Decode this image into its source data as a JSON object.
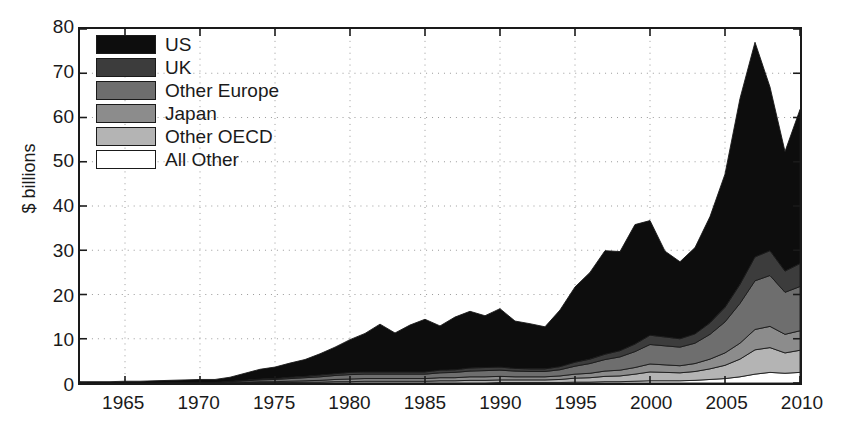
{
  "chart_data": {
    "type": "area",
    "stacked": true,
    "title": "",
    "subtitle": "",
    "xlabel": "",
    "ylabel": "$ billions",
    "xlim": [
      1962,
      2010
    ],
    "ylim": [
      0,
      80
    ],
    "yticks": [
      0,
      10,
      20,
      30,
      40,
      50,
      60,
      70,
      80
    ],
    "xticks": [
      1965,
      1970,
      1975,
      1980,
      1985,
      1990,
      1995,
      2000,
      2005,
      2010
    ],
    "grid": "dotted-both",
    "legend_position": "upper-left-inside",
    "x": [
      1962,
      1963,
      1964,
      1965,
      1966,
      1967,
      1968,
      1969,
      1970,
      1971,
      1972,
      1973,
      1974,
      1975,
      1976,
      1977,
      1978,
      1979,
      1980,
      1981,
      1982,
      1983,
      1984,
      1985,
      1986,
      1987,
      1988,
      1989,
      1990,
      1991,
      1992,
      1993,
      1994,
      1995,
      1996,
      1997,
      1998,
      1999,
      2000,
      2001,
      2002,
      2003,
      2004,
      2005,
      2006,
      2007,
      2008,
      2009,
      2010
    ],
    "series": [
      {
        "name": "All Other",
        "color": "#ffffff",
        "values": [
          0.0,
          0.0,
          0.0,
          0.0,
          0.0,
          0.0,
          0.0,
          0.0,
          0.0,
          0.0,
          0.0,
          0.0,
          0.0,
          0.0,
          0.0,
          0.0,
          0.0,
          0.0,
          0.0,
          0.0,
          0.0,
          0.0,
          0.0,
          0.0,
          0.0,
          0.0,
          0.0,
          0.0,
          0.1,
          0.1,
          0.1,
          0.1,
          0.1,
          0.2,
          0.2,
          0.3,
          0.3,
          0.4,
          0.5,
          0.5,
          0.5,
          0.6,
          0.8,
          1.0,
          1.4,
          2.0,
          2.4,
          2.2,
          2.4
        ]
      },
      {
        "name": "Other OECD",
        "color": "#b4b4b4",
        "values": [
          0.0,
          0.0,
          0.0,
          0.0,
          0.0,
          0.0,
          0.0,
          0.0,
          0.0,
          0.0,
          0.0,
          0.1,
          0.1,
          0.1,
          0.1,
          0.2,
          0.2,
          0.3,
          0.3,
          0.4,
          0.4,
          0.4,
          0.4,
          0.4,
          0.5,
          0.5,
          0.6,
          0.6,
          0.6,
          0.6,
          0.6,
          0.6,
          0.7,
          0.9,
          1.0,
          1.2,
          1.3,
          1.6,
          2.0,
          1.9,
          1.8,
          2.0,
          2.4,
          3.0,
          4.0,
          5.5,
          5.6,
          4.6,
          5.0
        ]
      },
      {
        "name": "Japan",
        "color": "#8c8c8c",
        "values": [
          0.0,
          0.0,
          0.0,
          0.0,
          0.0,
          0.0,
          0.0,
          0.0,
          0.0,
          0.0,
          0.1,
          0.1,
          0.2,
          0.2,
          0.3,
          0.3,
          0.4,
          0.5,
          0.6,
          0.6,
          0.6,
          0.6,
          0.6,
          0.6,
          0.7,
          0.7,
          0.8,
          0.8,
          0.8,
          0.7,
          0.7,
          0.7,
          0.8,
          0.9,
          1.0,
          1.2,
          1.3,
          1.5,
          1.8,
          1.7,
          1.6,
          1.8,
          2.2,
          2.8,
          3.6,
          4.6,
          4.8,
          4.2,
          4.4
        ]
      },
      {
        "name": "Other Europe",
        "color": "#6e6e6e",
        "values": [
          0.0,
          0.0,
          0.0,
          0.0,
          0.0,
          0.0,
          0.1,
          0.1,
          0.1,
          0.1,
          0.2,
          0.3,
          0.4,
          0.5,
          0.6,
          0.7,
          0.8,
          0.9,
          1.0,
          1.0,
          1.0,
          1.0,
          1.0,
          1.0,
          1.1,
          1.2,
          1.3,
          1.4,
          1.4,
          1.3,
          1.2,
          1.2,
          1.4,
          1.8,
          2.2,
          2.6,
          3.0,
          3.6,
          4.4,
          4.3,
          4.2,
          4.6,
          5.6,
          7.0,
          9.0,
          11.0,
          11.5,
          9.5,
          10.0
        ]
      },
      {
        "name": "UK",
        "color": "#3c3c3c",
        "values": [
          0.0,
          0.0,
          0.0,
          0.0,
          0.0,
          0.0,
          0.0,
          0.0,
          0.0,
          0.0,
          0.1,
          0.1,
          0.2,
          0.2,
          0.3,
          0.3,
          0.4,
          0.4,
          0.5,
          0.5,
          0.5,
          0.5,
          0.5,
          0.5,
          0.6,
          0.6,
          0.7,
          0.7,
          0.7,
          0.6,
          0.6,
          0.6,
          0.7,
          0.9,
          1.0,
          1.2,
          1.4,
          1.7,
          2.1,
          2.0,
          1.9,
          2.1,
          2.6,
          3.3,
          4.3,
          5.4,
          5.6,
          4.8,
          5.2
        ]
      },
      {
        "name": "US",
        "color": "#0d0d0d",
        "values": [
          0.3,
          0.3,
          0.3,
          0.4,
          0.4,
          0.5,
          0.5,
          0.6,
          0.7,
          0.7,
          0.9,
          1.6,
          2.2,
          2.6,
          3.2,
          3.8,
          4.8,
          6.0,
          7.4,
          8.7,
          10.8,
          8.8,
          10.6,
          11.9,
          10.0,
          11.9,
          12.8,
          11.7,
          13.2,
          10.7,
          10.2,
          9.5,
          12.8,
          17.0,
          19.6,
          23.4,
          22.4,
          27.0,
          25.9,
          19.4,
          17.4,
          19.5,
          24.0,
          30.1,
          42.0,
          48.5,
          37.0,
          27.0,
          34.8
        ]
      }
    ]
  },
  "axes": {
    "y_title": "$ billions",
    "y_labels": [
      "80",
      "70",
      "60",
      "50",
      "40",
      "30",
      "20",
      "10",
      "0"
    ],
    "x_labels": [
      "1965",
      "1970",
      "1975",
      "1980",
      "1985",
      "1990",
      "1995",
      "2000",
      "2005",
      "2010"
    ]
  },
  "legend": {
    "items": [
      {
        "label": "US",
        "color": "#0d0d0d"
      },
      {
        "label": "UK",
        "color": "#3c3c3c"
      },
      {
        "label": "Other Europe",
        "color": "#6e6e6e"
      },
      {
        "label": "Japan",
        "color": "#8c8c8c"
      },
      {
        "label": "Other OECD",
        "color": "#b4b4b4"
      },
      {
        "label": "All Other",
        "color": "#ffffff"
      }
    ]
  },
  "style": {
    "axis_color": "#1a1a1a",
    "grid_color": "#999999",
    "background": "#ffffff",
    "outline_color": "#1a1a1a"
  }
}
